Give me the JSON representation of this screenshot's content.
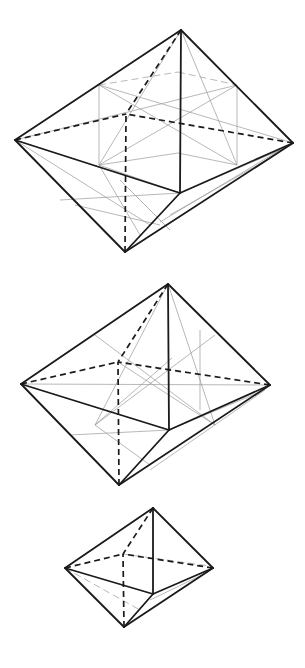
{
  "figure": {
    "colors": {
      "edge": "#1a1a1a",
      "construction": "#9a9a9a",
      "background": "#ffffff"
    },
    "octahedra": [
      {
        "name": "large-octahedron",
        "vertices": {
          "top": [
            181,
            30
          ],
          "left": [
            15,
            140
          ],
          "right": [
            293,
            143
          ],
          "bottom": [
            125,
            252
          ],
          "front": [
            180,
            193
          ],
          "back": [
            126,
            114
          ]
        },
        "construction_lines": [
          [
            [
              99,
              85
            ],
            [
              178,
              72
            ]
          ],
          [
            [
              178,
              72
            ],
            [
              237,
              85
            ]
          ],
          [
            [
              99,
              85
            ],
            [
              99,
              165
            ]
          ],
          [
            [
              237,
              85
            ],
            [
              237,
              165
            ]
          ],
          [
            [
              99,
              165
            ],
            [
              178,
              153
            ]
          ],
          [
            [
              178,
              153
            ],
            [
              237,
              165
            ]
          ],
          [
            [
              99,
              85
            ],
            [
              237,
              165
            ]
          ],
          [
            [
              237,
              85
            ],
            [
              99,
              165
            ]
          ],
          [
            [
              99,
              85
            ],
            [
              293,
              143
            ]
          ],
          [
            [
              237,
              85
            ],
            [
              15,
              140
            ]
          ],
          [
            [
              181,
              30
            ],
            [
              99,
              165
            ]
          ],
          [
            [
              181,
              30
            ],
            [
              237,
              165
            ]
          ],
          [
            [
              15,
              140
            ],
            [
              180,
              193
            ]
          ],
          [
            [
              99,
              165
            ],
            [
              180,
              193
            ]
          ],
          [
            [
              15,
              140
            ],
            [
              150,
              225
            ]
          ],
          [
            [
              60,
              200
            ],
            [
              180,
              193
            ]
          ],
          [
            [
              75,
              205
            ],
            [
              160,
              225
            ]
          ],
          [
            [
              99,
              165
            ],
            [
              140,
              235
            ]
          ],
          [
            [
              120,
              180
            ],
            [
              170,
              230
            ]
          ],
          [
            [
              180,
              193
            ],
            [
              285,
              148
            ]
          ],
          [
            [
              160,
              222
            ],
            [
              280,
              150
            ]
          ],
          [
            [
              170,
              215
            ],
            [
              270,
              158
            ]
          ]
        ],
        "dashed_construction": [
          [
            [
              99,
              85
            ],
            [
              178,
              72
            ]
          ],
          [
            [
              178,
              72
            ],
            [
              237,
              85
            ]
          ],
          [
            [
              99,
              165
            ],
            [
              237,
              165
            ]
          ],
          [
            [
              15,
              140
            ],
            [
              237,
              165
            ]
          ]
        ]
      },
      {
        "name": "medium-octahedron",
        "vertices": {
          "top": [
            168,
            284
          ],
          "left": [
            21,
            384
          ],
          "right": [
            270,
            385
          ],
          "bottom": [
            119,
            485
          ],
          "front": [
            169,
            430
          ],
          "back": [
            118,
            362
          ]
        },
        "construction_lines": [
          [
            [
              95,
              335
            ],
            [
              215,
              425
            ]
          ],
          [
            [
              215,
              335
            ],
            [
              95,
              425
            ]
          ],
          [
            [
              168,
              284
            ],
            [
              95,
              425
            ]
          ],
          [
            [
              168,
              284
            ],
            [
              215,
              425
            ]
          ],
          [
            [
              21,
              384
            ],
            [
              270,
              385
            ]
          ],
          [
            [
              118,
              362
            ],
            [
              215,
              425
            ]
          ],
          [
            [
              172,
              358
            ],
            [
              95,
              425
            ]
          ],
          [
            [
              21,
              384
            ],
            [
              169,
              430
            ]
          ],
          [
            [
              70,
              435
            ],
            [
              169,
              430
            ]
          ],
          [
            [
              95,
              425
            ],
            [
              150,
              465
            ]
          ],
          [
            [
              169,
              430
            ],
            [
              260,
              392
            ]
          ],
          [
            [
              150,
              470
            ],
            [
              265,
              390
            ]
          ],
          [
            [
              200,
              330
            ],
            [
              200,
              410
            ]
          ]
        ],
        "dashed_construction": [
          [
            [
              118,
              362
            ],
            [
              172,
              358
            ]
          ],
          [
            [
              172,
              358
            ],
            [
              270,
              385
            ]
          ],
          [
            [
              21,
              384
            ],
            [
              169,
              430
            ]
          ],
          [
            [
              21,
              384
            ],
            [
              150,
              470
            ]
          ]
        ]
      },
      {
        "name": "small-octahedron",
        "vertices": {
          "top": [
            153,
            508
          ],
          "left": [
            65,
            568
          ],
          "right": [
            213,
            568
          ],
          "bottom": [
            124,
            627
          ],
          "front": [
            153,
            594
          ],
          "back": [
            123,
            554
          ]
        },
        "construction_lines": [
          [
            [
              123,
              554
            ],
            [
              210,
              566
            ]
          ],
          [
            [
              65,
              568
            ],
            [
              140,
              610
            ]
          ],
          [
            [
              150,
              600
            ],
            [
              208,
              572
            ]
          ]
        ],
        "dashed_construction": [
          [
            [
              123,
              554
            ],
            [
              210,
              566
            ]
          ],
          [
            [
              65,
              568
            ],
            [
              140,
              610
            ]
          ]
        ]
      }
    ]
  }
}
